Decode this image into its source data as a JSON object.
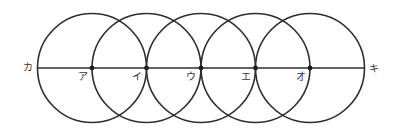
{
  "diagram": {
    "line": {
      "left_end_label": "カ",
      "right_end_label": "キ"
    },
    "points": [
      {
        "id": "a",
        "label": "ア"
      },
      {
        "id": "i",
        "label": "イ"
      },
      {
        "id": "u",
        "label": "ウ"
      },
      {
        "id": "e",
        "label": "エ"
      },
      {
        "id": "o",
        "label": "オ"
      }
    ],
    "circle_count": 5,
    "colors": {
      "stroke": "#2e2e2e",
      "dot": "#1e1e1e",
      "label": "#333333"
    }
  }
}
